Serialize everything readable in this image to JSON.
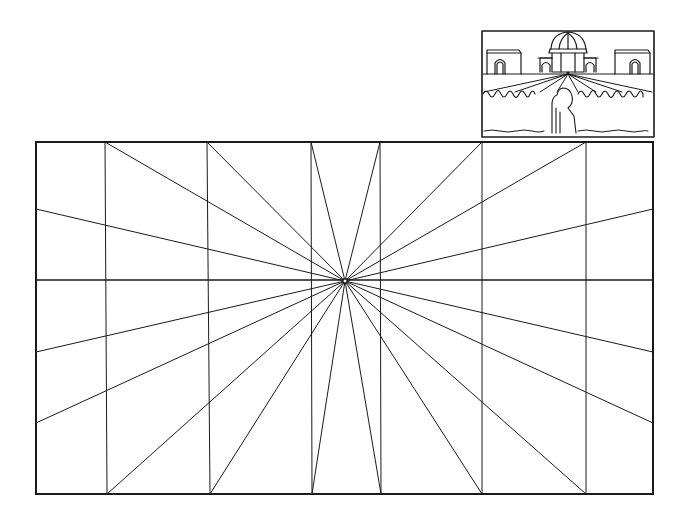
{
  "diagram": {
    "type": "one-point-perspective-grid",
    "frame": {
      "x1": 36,
      "y1": 142,
      "x2": 653,
      "y2": 494
    },
    "vanishing_point": {
      "x": 345,
      "y": 281
    },
    "horizon_y": 280,
    "vertical_lines_x": [
      105,
      207,
      311,
      380,
      482,
      586
    ],
    "radial_endpoints": [
      {
        "x": 105,
        "y": 142
      },
      {
        "x": 207,
        "y": 142
      },
      {
        "x": 311,
        "y": 142
      },
      {
        "x": 380,
        "y": 142
      },
      {
        "x": 482,
        "y": 142
      },
      {
        "x": 586,
        "y": 142
      },
      {
        "x": 653,
        "y": 209
      },
      {
        "x": 653,
        "y": 352
      },
      {
        "x": 653,
        "y": 423
      },
      {
        "x": 586,
        "y": 494
      },
      {
        "x": 482,
        "y": 494
      },
      {
        "x": 381,
        "y": 494
      },
      {
        "x": 312,
        "y": 494
      },
      {
        "x": 210,
        "y": 494
      },
      {
        "x": 107,
        "y": 494
      },
      {
        "x": 36,
        "y": 423
      },
      {
        "x": 36,
        "y": 352
      },
      {
        "x": 36,
        "y": 209
      }
    ],
    "line_color": "#1a1a1a",
    "frame_stroke": 2,
    "grid_stroke": 1
  },
  "inset": {
    "description": "domed building with flanking gatehouses, converging avenue rays, hedge row, standing figure",
    "frame": {
      "x1": 482,
      "y1": 31,
      "x2": 654,
      "y2": 137
    },
    "vanishing_point": {
      "x": 568,
      "y": 74
    }
  }
}
